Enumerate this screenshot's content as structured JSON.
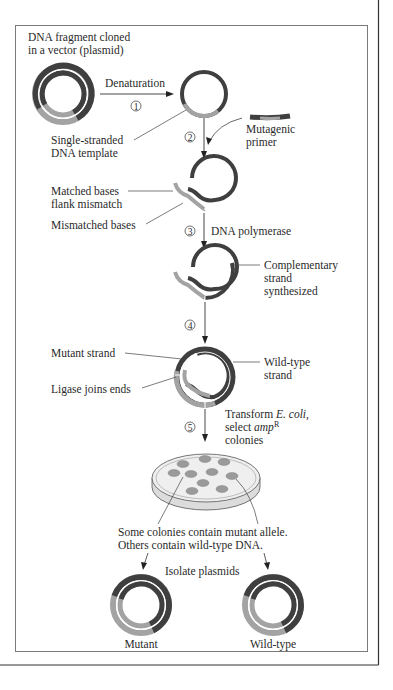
{
  "colors": {
    "dark_strand": "#3f3f3f",
    "light_strand": "#a3a3a3",
    "text": "#2a2a2a",
    "frame": "#6a6a6a",
    "outer_frame": "#333333",
    "plate_fill": "#ececec",
    "colony": "#9a9a9a"
  },
  "title": {
    "line1": "DNA fragment cloned",
    "line2": "in a vector (plasmid)"
  },
  "steps": [
    {
      "number": "1",
      "label": "Denaturation"
    },
    {
      "number": "2",
      "label": ""
    },
    {
      "number": "3",
      "label": "DNA polymerase"
    },
    {
      "number": "4",
      "label": ""
    },
    {
      "number": "5",
      "label_line1": "Transform",
      "label_italic1": "E. coli,",
      "label_line2": "select",
      "label_italic2": "amp",
      "label_sup": "R",
      "label_line3": "colonies"
    }
  ],
  "labels": {
    "ss_template_1": "Single-stranded",
    "ss_template_2": "DNA template",
    "mutagenic_1": "Mutagenic",
    "mutagenic_2": "primer",
    "matched_1": "Matched bases",
    "matched_2": "flank mismatch",
    "mismatched": "Mismatched bases",
    "complementary_1": "Complementary",
    "complementary_2": "strand",
    "complementary_3": "synthesized",
    "mutant_strand": "Mutant strand",
    "wildtype_strand_1": "Wild-type",
    "wildtype_strand_2": "strand",
    "ligase": "Ligase joins ends",
    "colonies_1": "Some colonies contain mutant allele.",
    "colonies_2": "Others contain wild-type DNA.",
    "isolate": "Isolate plasmids",
    "result_mutant": "Mutant",
    "result_wildtype": "Wild-type"
  }
}
